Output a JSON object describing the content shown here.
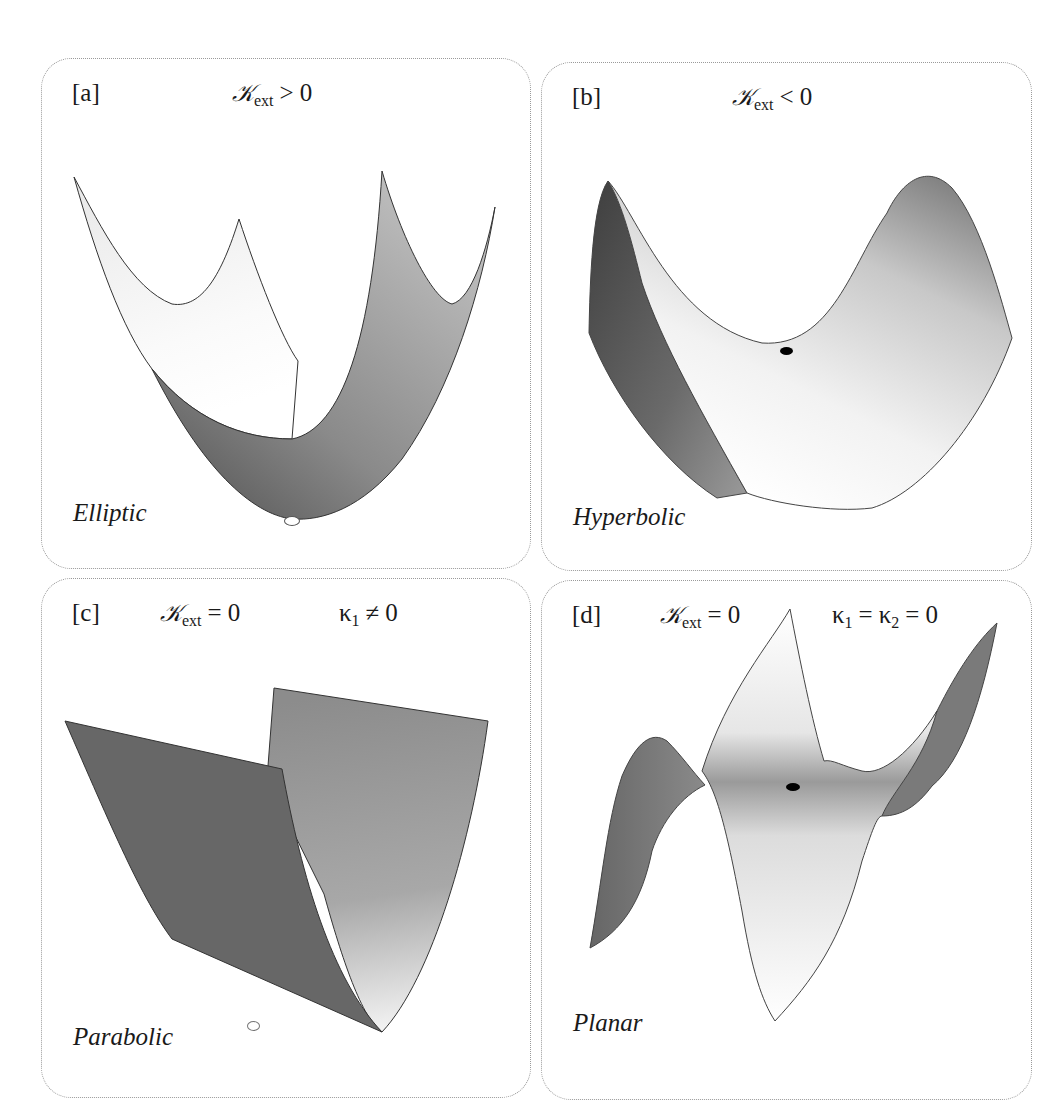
{
  "panels": [
    {
      "id": "a",
      "tag": "[a]",
      "condition": {
        "symbol": "𝒦",
        "sub": "ext",
        "op": ">",
        "value": "0"
      },
      "name": "Elliptic",
      "point_color": "#ffffff"
    },
    {
      "id": "b",
      "tag": "[b]",
      "condition": {
        "symbol": "𝒦",
        "sub": "ext",
        "op": "<",
        "value": "0"
      },
      "name": "Hyperbolic",
      "point_color": "#000000"
    },
    {
      "id": "c",
      "tag": "[c]",
      "condition": {
        "symbol": "𝒦",
        "sub": "ext",
        "op": "=",
        "value": "0"
      },
      "extra": {
        "k1": "κ",
        "k1_sub": "1",
        "op": "≠",
        "value": "0"
      },
      "name": "Parabolic",
      "point_color": "#ffffff"
    },
    {
      "id": "d",
      "tag": "[d]",
      "condition": {
        "symbol": "𝒦",
        "sub": "ext",
        "op": "=",
        "value": "0"
      },
      "extra": {
        "k1": "κ",
        "k1_sub": "1",
        "op1": "=",
        "k2": "κ",
        "k2_sub": "2",
        "op2": "=",
        "value": "0"
      },
      "name": "Planar",
      "point_color": "#000000"
    }
  ]
}
